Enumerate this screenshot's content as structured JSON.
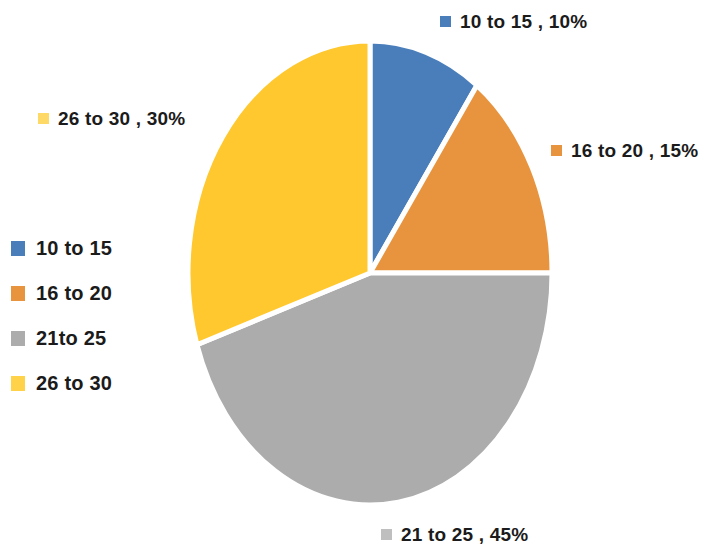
{
  "chart_data": {
    "type": "pie",
    "title": "",
    "categories": [
      "10 to 15",
      "16 to 20",
      "21to 25",
      "26 to 30"
    ],
    "values": [
      10,
      15,
      45,
      30
    ],
    "value_unit": "%",
    "colors": [
      "#4A7EBB",
      "#E8943F",
      "#ACACAC",
      "#FFC82E"
    ],
    "separator_color": "#FFFFFF",
    "start_angle_deg": 0,
    "direction": "clockwise",
    "legend_position": "left",
    "data_labels_position": "outside",
    "grid": false,
    "slices": [
      {
        "label": "10 to 15",
        "value": 10,
        "percent": "10%",
        "color": "#4A7EBB"
      },
      {
        "label": "16 to 20",
        "value": 15,
        "percent": "15%",
        "color": "#E8943F"
      },
      {
        "label": "21 to 25",
        "value": 45,
        "percent": "45%",
        "color": "#ACACAC"
      },
      {
        "label": "26 to 30",
        "value": 30,
        "percent": "30%",
        "color": "#FFC82E"
      }
    ]
  },
  "data_labels": [
    {
      "text": "10 to 15 , 10%",
      "color": "#4A7EBB"
    },
    {
      "text": "16 to 20 , 15%",
      "color": "#E8943F"
    },
    {
      "text": "21 to 25 , 45%",
      "color": "#BFBFBF"
    },
    {
      "text": "26 to 30 , 30%",
      "color": "#FFD966"
    }
  ],
  "legend": {
    "items": [
      {
        "label": "10 to 15",
        "color": "#4A7EBB"
      },
      {
        "label": "16 to 20",
        "color": "#E8943F"
      },
      {
        "label": "21to 25",
        "color": "#ACACAC"
      },
      {
        "label": "26 to 30",
        "color": "#FFD24A"
      }
    ]
  }
}
